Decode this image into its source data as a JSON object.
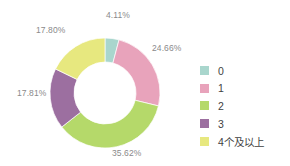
{
  "chart_data": {
    "type": "pie",
    "variant": "donut",
    "title": "",
    "subtitle": "",
    "xlabel": "",
    "ylabel": "",
    "grid": false,
    "legend_position": "right",
    "start_angle_deg": 0,
    "direction": "clockwise",
    "center": {
      "x": 105,
      "y": 93
    },
    "outer_radius": 55,
    "inner_radius": 31,
    "categories": [
      "0",
      "1",
      "2",
      "3",
      "4个及以上"
    ],
    "values": [
      4.11,
      24.66,
      35.62,
      17.81,
      17.8
    ],
    "value_labels": [
      "4.11%",
      "24.66%",
      "35.62%",
      "17.81%",
      "17.80%"
    ],
    "colors": [
      "#a9d6cd",
      "#e8a3bb",
      "#b5d96a",
      "#9c6fa0",
      "#e7e87f"
    ],
    "slices": [
      {
        "label": "0",
        "value": 4.11,
        "value_label": "4.11%",
        "color": "#a9d6cd"
      },
      {
        "label": "1",
        "value": 24.66,
        "value_label": "24.66%",
        "color": "#e8a3bb"
      },
      {
        "label": "2",
        "value": 35.62,
        "value_label": "35.62%",
        "color": "#b5d96a"
      },
      {
        "label": "3",
        "value": 17.81,
        "value_label": "17.81%",
        "color": "#9c6fa0"
      },
      {
        "label": "4个及以上",
        "value": 17.8,
        "value_label": "17.80%",
        "color": "#e7e87f"
      }
    ]
  },
  "legend": {
    "items": [
      {
        "label": "0",
        "color": "#a9d6cd"
      },
      {
        "label": "1",
        "color": "#e8a3bb"
      },
      {
        "label": "2",
        "color": "#b5d96a"
      },
      {
        "label": "3",
        "color": "#9c6fa0"
      },
      {
        "label": "4个及以上",
        "color": "#e7e87f"
      }
    ]
  },
  "style": {
    "background": "#ffffff",
    "label_color": "#8a8a8a",
    "legend_text_color": "#3f3f3f"
  }
}
